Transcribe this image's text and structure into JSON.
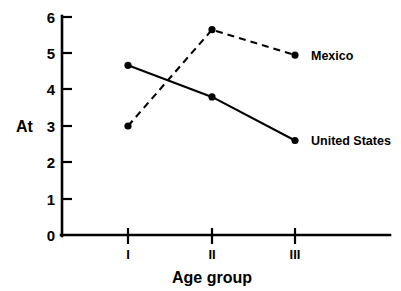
{
  "chart_data": {
    "type": "line",
    "title": "",
    "xlabel": "Age group",
    "ylabel": "At",
    "categories": [
      "I",
      "II",
      "III"
    ],
    "ylim": [
      0,
      6
    ],
    "yticks": [
      "0",
      "1",
      "2",
      "3",
      "4",
      "5",
      "6"
    ],
    "grid": false,
    "legend_position": "inline-right",
    "series": [
      {
        "name": "Mexico",
        "label": "Mexico",
        "linestyle": "dashed",
        "marker": "filled-circle",
        "color": "#000000",
        "values": [
          3.0,
          5.65,
          4.95
        ]
      },
      {
        "name": "United States",
        "label": "United States",
        "linestyle": "solid",
        "marker": "filled-circle",
        "color": "#000000",
        "values": [
          4.67,
          3.8,
          2.6
        ]
      }
    ]
  },
  "axes": {
    "y_title": "At",
    "x_title": "Age group",
    "y_tick_labels": [
      "6",
      "5",
      "4",
      "3",
      "2",
      "1",
      "0"
    ],
    "x_tick_labels": [
      "I",
      "II",
      "III"
    ]
  },
  "labels": {
    "mexico": "Mexico",
    "united_states": "United States"
  }
}
